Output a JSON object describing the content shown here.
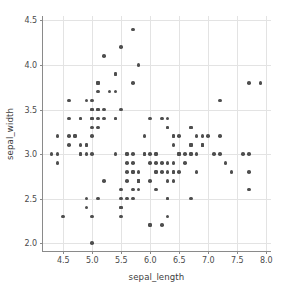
{
  "chart_data": {
    "type": "scatter",
    "title": "",
    "xlabel": "sepal_length",
    "ylabel": "sepal_width",
    "xlim": [
      4.15,
      8.1
    ],
    "ylim": [
      1.9,
      4.55
    ],
    "xticks": [
      "4.5",
      "5.0",
      "5.5",
      "6.0",
      "6.5",
      "7.0",
      "7.5",
      "8.0"
    ],
    "xtick_values": [
      4.5,
      5.0,
      5.5,
      6.0,
      6.5,
      7.0,
      7.5,
      8.0
    ],
    "yticks": [
      "2.0",
      "2.5",
      "3.0",
      "3.5",
      "4.0",
      "4.5"
    ],
    "ytick_values": [
      2.0,
      2.5,
      3.0,
      3.5,
      4.0,
      4.5
    ],
    "grid": true,
    "legend": "none",
    "marker_color": "#4e4e4e",
    "marker_size": 3.6,
    "grid_color": "#e3e3e3",
    "spine_color": "#8a8a8a",
    "background": "#ffffff",
    "points": [
      [
        5.1,
        3.5
      ],
      [
        4.9,
        3.0
      ],
      [
        4.7,
        3.2
      ],
      [
        4.6,
        3.1
      ],
      [
        5.0,
        3.6
      ],
      [
        5.4,
        3.9
      ],
      [
        4.6,
        3.4
      ],
      [
        5.0,
        3.4
      ],
      [
        4.4,
        2.9
      ],
      [
        4.9,
        3.1
      ],
      [
        5.4,
        3.7
      ],
      [
        4.8,
        3.4
      ],
      [
        4.8,
        3.0
      ],
      [
        4.3,
        3.0
      ],
      [
        5.8,
        4.0
      ],
      [
        5.7,
        4.4
      ],
      [
        5.4,
        3.9
      ],
      [
        5.1,
        3.5
      ],
      [
        5.7,
        3.8
      ],
      [
        5.1,
        3.8
      ],
      [
        5.4,
        3.4
      ],
      [
        5.1,
        3.7
      ],
      [
        4.6,
        3.6
      ],
      [
        5.1,
        3.3
      ],
      [
        4.8,
        3.4
      ],
      [
        5.0,
        3.0
      ],
      [
        5.0,
        3.4
      ],
      [
        5.2,
        3.5
      ],
      [
        5.2,
        3.4
      ],
      [
        4.7,
        3.2
      ],
      [
        4.8,
        3.1
      ],
      [
        5.4,
        3.4
      ],
      [
        5.2,
        4.1
      ],
      [
        5.5,
        4.2
      ],
      [
        4.9,
        3.1
      ],
      [
        5.0,
        3.2
      ],
      [
        5.5,
        3.5
      ],
      [
        4.9,
        3.6
      ],
      [
        4.4,
        3.0
      ],
      [
        5.1,
        3.4
      ],
      [
        5.0,
        3.5
      ],
      [
        4.5,
        2.3
      ],
      [
        4.4,
        3.2
      ],
      [
        5.0,
        3.5
      ],
      [
        5.1,
        3.8
      ],
      [
        4.8,
        3.0
      ],
      [
        5.1,
        3.8
      ],
      [
        4.6,
        3.2
      ],
      [
        5.3,
        3.7
      ],
      [
        5.0,
        3.3
      ],
      [
        7.0,
        3.2
      ],
      [
        6.4,
        3.2
      ],
      [
        6.9,
        3.1
      ],
      [
        5.5,
        2.3
      ],
      [
        6.5,
        2.8
      ],
      [
        5.7,
        2.8
      ],
      [
        6.3,
        3.3
      ],
      [
        4.9,
        2.4
      ],
      [
        6.6,
        2.9
      ],
      [
        5.2,
        2.7
      ],
      [
        5.0,
        2.0
      ],
      [
        5.9,
        3.0
      ],
      [
        6.0,
        2.2
      ],
      [
        6.1,
        2.9
      ],
      [
        5.6,
        2.9
      ],
      [
        6.7,
        3.1
      ],
      [
        5.6,
        3.0
      ],
      [
        5.8,
        2.7
      ],
      [
        6.2,
        2.2
      ],
      [
        5.6,
        2.5
      ],
      [
        5.9,
        3.2
      ],
      [
        6.1,
        2.8
      ],
      [
        6.3,
        2.5
      ],
      [
        6.1,
        2.8
      ],
      [
        6.4,
        2.9
      ],
      [
        6.6,
        3.0
      ],
      [
        6.8,
        2.8
      ],
      [
        6.7,
        3.0
      ],
      [
        6.0,
        2.9
      ],
      [
        5.7,
        2.6
      ],
      [
        5.5,
        2.4
      ],
      [
        5.5,
        2.4
      ],
      [
        5.8,
        2.7
      ],
      [
        6.0,
        2.7
      ],
      [
        5.4,
        3.0
      ],
      [
        6.0,
        3.4
      ],
      [
        6.7,
        3.1
      ],
      [
        6.3,
        2.3
      ],
      [
        5.6,
        3.0
      ],
      [
        5.5,
        2.5
      ],
      [
        5.5,
        2.6
      ],
      [
        6.1,
        3.0
      ],
      [
        5.8,
        2.6
      ],
      [
        5.0,
        2.3
      ],
      [
        5.6,
        2.7
      ],
      [
        5.7,
        3.0
      ],
      [
        5.7,
        2.9
      ],
      [
        6.2,
        2.9
      ],
      [
        5.1,
        2.5
      ],
      [
        5.7,
        2.8
      ],
      [
        6.3,
        3.3
      ],
      [
        5.8,
        2.7
      ],
      [
        7.1,
        3.0
      ],
      [
        6.3,
        2.9
      ],
      [
        6.5,
        3.0
      ],
      [
        7.6,
        3.0
      ],
      [
        4.9,
        2.5
      ],
      [
        7.3,
        2.9
      ],
      [
        6.7,
        2.5
      ],
      [
        7.2,
        3.6
      ],
      [
        6.5,
        3.2
      ],
      [
        6.4,
        2.7
      ],
      [
        6.8,
        3.0
      ],
      [
        5.7,
        2.5
      ],
      [
        5.8,
        2.8
      ],
      [
        6.4,
        3.2
      ],
      [
        6.5,
        3.0
      ],
      [
        7.7,
        3.8
      ],
      [
        7.7,
        2.6
      ],
      [
        6.0,
        2.2
      ],
      [
        6.9,
        3.2
      ],
      [
        5.6,
        2.8
      ],
      [
        7.7,
        2.8
      ],
      [
        6.3,
        2.7
      ],
      [
        6.7,
        3.3
      ],
      [
        7.2,
        3.2
      ],
      [
        6.2,
        2.8
      ],
      [
        6.1,
        3.0
      ],
      [
        6.4,
        2.8
      ],
      [
        7.2,
        3.0
      ],
      [
        7.4,
        2.8
      ],
      [
        7.9,
        3.8
      ],
      [
        6.4,
        2.8
      ],
      [
        6.3,
        2.8
      ],
      [
        6.1,
        2.6
      ],
      [
        7.7,
        3.0
      ],
      [
        6.3,
        3.4
      ],
      [
        6.4,
        3.1
      ],
      [
        6.0,
        3.0
      ],
      [
        6.9,
        3.1
      ],
      [
        6.7,
        3.1
      ],
      [
        6.9,
        3.1
      ],
      [
        5.8,
        2.7
      ],
      [
        6.8,
        3.2
      ],
      [
        6.7,
        3.3
      ],
      [
        6.7,
        3.0
      ],
      [
        6.3,
        2.5
      ],
      [
        6.5,
        3.0
      ],
      [
        6.2,
        3.4
      ],
      [
        5.9,
        3.0
      ]
    ]
  }
}
